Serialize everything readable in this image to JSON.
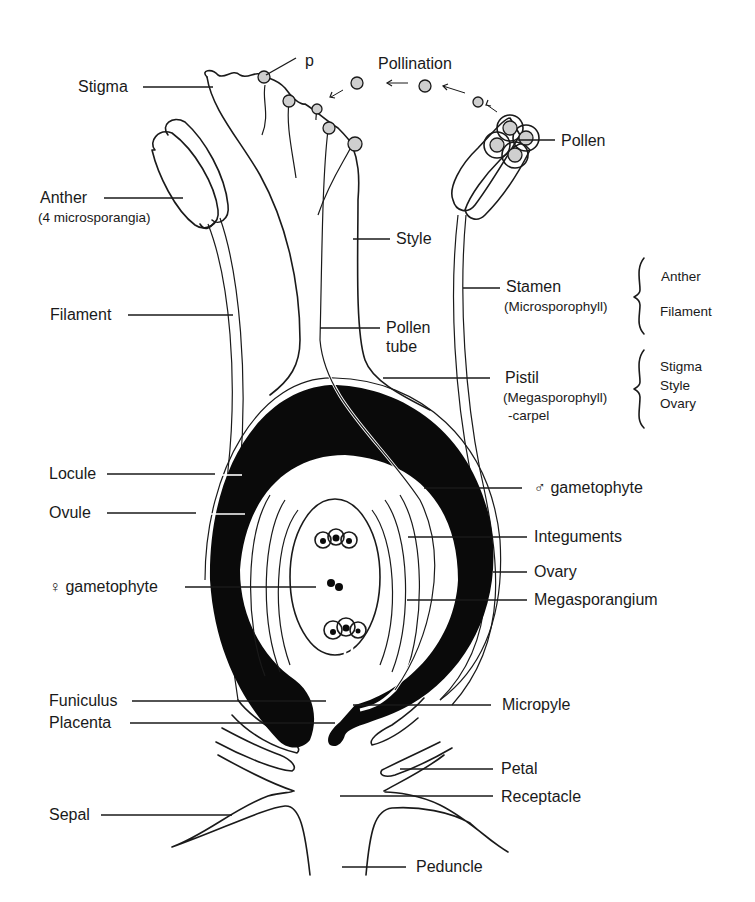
{
  "labels": {
    "p": "p",
    "pollination": "Pollination",
    "stigma": "Stigma",
    "pollen": "Pollen",
    "anther": "Anther",
    "anther_note": "(4 microsporangia)",
    "style": "Style",
    "filament": "Filament",
    "pollen_tube_1": "Pollen",
    "pollen_tube_2": "tube",
    "stamen": "Stamen",
    "stamen_note": "(Microsporophyll)",
    "pistil": "Pistil",
    "pistil_note": "(Megasporophyll)",
    "pistil_note2": "-carpel",
    "locule": "Locule",
    "ovule": "Ovule",
    "male_gametophyte": "♂ gametophyte",
    "integuments": "Integuments",
    "ovary": "Ovary",
    "female_gametophyte": "♀ gametophyte",
    "megasporangium": "Megasporangium",
    "funiculus": "Funiculus",
    "micropyle": "Micropyle",
    "placenta": "Placenta",
    "petal": "Petal",
    "receptacle": "Receptacle",
    "sepal": "Sepal",
    "peduncle": "Peduncle"
  },
  "groups": {
    "stamen_parts": [
      "Anther",
      "Filament"
    ],
    "pistil_parts": [
      "Stigma",
      "Style",
      "Ovary"
    ]
  },
  "colors": {
    "ink": "#1a1a1a",
    "fill_black": "#0a0a0a",
    "background": "#ffffff",
    "pollen_grain": "#cfcfcf"
  }
}
